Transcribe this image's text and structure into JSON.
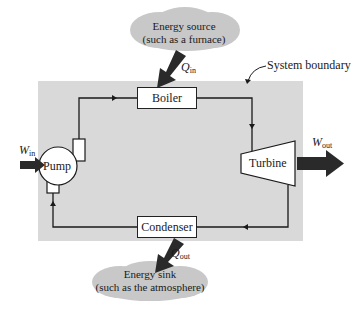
{
  "diagram": {
    "system_boundary_label": "System boundary",
    "components": {
      "boiler": "Boiler",
      "turbine": "Turbine",
      "condenser": "Condenser",
      "pump": "Pump"
    },
    "energy_source": {
      "line1": "Energy source",
      "line2": "(such as a furnace)"
    },
    "energy_sink": {
      "line1": "Energy sink",
      "line2": "(such as the atmosphere)"
    },
    "flows": {
      "q_in": {
        "symbol": "Q",
        "sub": "in"
      },
      "q_out": {
        "symbol": "Q",
        "sub": "out"
      },
      "w_in": {
        "symbol": "W",
        "sub": "in"
      },
      "w_out": {
        "symbol": "W",
        "sub": "out"
      }
    },
    "colors": {
      "boundary": "#d9d9d9",
      "cloud": "#c8c8c8",
      "arrow": "#2a2a2a",
      "line": "#1a1a1a"
    }
  }
}
